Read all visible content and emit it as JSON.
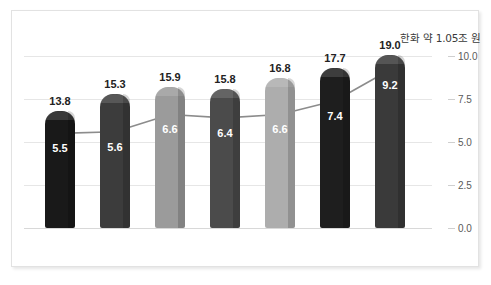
{
  "annotation": {
    "text": "한화 약 1.05조 원"
  },
  "chart_data": {
    "type": "bar",
    "title": "",
    "subtitle": "",
    "xlabel": "",
    "ylabel": "",
    "categories": [
      "2015",
      "2016",
      "2017",
      "2018",
      "2019",
      "2020",
      "2021"
    ],
    "series": [
      {
        "name": "bar",
        "type": "bar",
        "values": [
          13.8,
          15.3,
          15.9,
          15.8,
          16.8,
          17.7,
          19.0
        ],
        "labels": [
          "13.8",
          "15.3",
          "15.9",
          "15.8",
          "16.8",
          "17.7",
          "19.0"
        ],
        "colors": [
          "#191919",
          "#3c3c3c",
          "#9b9b9b",
          "#4b4b4b",
          "#adadad",
          "#1e1e1e",
          "#3a3a3a"
        ]
      },
      {
        "name": "line",
        "type": "line",
        "values": [
          5.5,
          5.6,
          6.6,
          6.4,
          6.6,
          7.4,
          9.2
        ],
        "labels": [
          "5.5",
          "5.6",
          "6.6",
          "6.4",
          "6.6",
          "7.4",
          "9.2"
        ],
        "color": "#8c8c8c",
        "marker_color": "#a8a8a8"
      }
    ],
    "yticks": [
      "0.0",
      "2.5",
      "5.0",
      "7.5",
      "10.0"
    ],
    "ytick_values": [
      0.0,
      2.5,
      5.0,
      7.5,
      10.0
    ],
    "ylim": [
      0.0,
      10.0
    ],
    "y_axis_position": "right",
    "grid": true,
    "legend": "none",
    "annotations": [
      "한화 약 1.05조 원"
    ]
  },
  "geometry": {
    "bar_pixel_heights": [
      117,
      134,
      141,
      139,
      150,
      160,
      173
    ],
    "bar_left_positions": [
      21,
      76,
      131,
      186,
      241,
      296,
      351
    ],
    "bar_width": 30,
    "plot_height": 172,
    "plot_width": 408
  }
}
